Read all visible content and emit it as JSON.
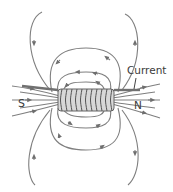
{
  "diagram": {
    "labels": {
      "current": "Current",
      "south": "S",
      "north": "N"
    },
    "colors": {
      "field_line": "#7a7a7a",
      "coil": "#5a5a5a",
      "text": "#3a3a3a",
      "background": "#ffffff"
    }
  }
}
